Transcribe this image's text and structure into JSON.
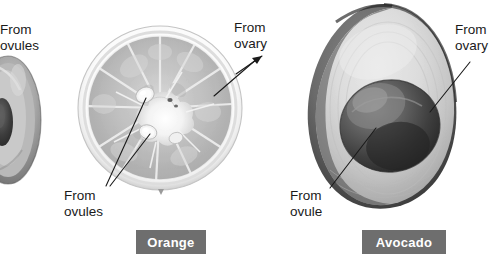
{
  "figure": {
    "background_color": "#ffffff",
    "text_color": "#1a1a1a",
    "caption_box_color": "#6e6e6e",
    "caption_text_color": "#ffffff"
  },
  "callouts": {
    "left_ovules": "From\novules",
    "orange_ovary": "From\novary",
    "orange_ovules": "From\novules",
    "avocado_ovary": "From\novary",
    "avocado_ovule": "From\novule"
  },
  "captions": {
    "orange": "Orange",
    "avocado": "Avocado"
  },
  "specimens": [
    {
      "name": "partial-fruit-left",
      "caption": "",
      "description": "cut-off fruit cross section at left edge"
    },
    {
      "name": "orange",
      "caption": "Orange",
      "description": "orange cross section showing radial segments, central core and seeds"
    },
    {
      "name": "avocado",
      "caption": "Avocado",
      "description": "avocado half showing large central pit and flesh"
    }
  ]
}
